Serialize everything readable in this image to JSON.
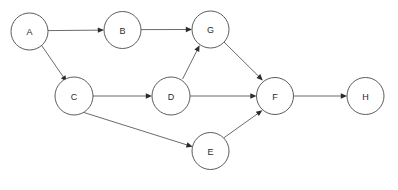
{
  "diagram": {
    "type": "directed-graph",
    "title": "",
    "canvas": {
      "width": 398,
      "height": 190,
      "background": "#ffffff"
    },
    "style": {
      "node_fill": "#ffffff",
      "node_stroke": "#4a4a4a",
      "node_stroke_width": 0.9,
      "edge_stroke": "#5a5a5a",
      "edge_stroke_width": 0.9,
      "arrowhead_fill": "#2b2b2b",
      "label_color": "#2b2b2b",
      "label_font_size": 9
    },
    "nodes": [
      {
        "id": "A",
        "label": "A",
        "cx": 29.5,
        "cy": 31.5,
        "r": 18.5
      },
      {
        "id": "B",
        "label": "B",
        "cx": 122.5,
        "cy": 30.0,
        "r": 18.5
      },
      {
        "id": "G",
        "label": "G",
        "cx": 210.5,
        "cy": 29.5,
        "r": 18.5
      },
      {
        "id": "C",
        "label": "C",
        "cx": 74.0,
        "cy": 96.0,
        "r": 19.0
      },
      {
        "id": "D",
        "label": "D",
        "cx": 171.0,
        "cy": 96.0,
        "r": 19.0
      },
      {
        "id": "F",
        "label": "F",
        "cx": 275.0,
        "cy": 96.0,
        "r": 18.5
      },
      {
        "id": "H",
        "label": "H",
        "cx": 365.5,
        "cy": 96.0,
        "r": 18.5
      },
      {
        "id": "E",
        "label": "E",
        "cx": 210.5,
        "cy": 151.0,
        "r": 18.5
      }
    ],
    "edges": [
      {
        "id": "A-B",
        "from": "A",
        "to": "B",
        "label": "",
        "directed": true,
        "x1": 48.0,
        "y1": 30.6,
        "x2": 104.0,
        "y2": 30.1
      },
      {
        "id": "B-G",
        "from": "B",
        "to": "G",
        "label": "",
        "directed": true,
        "x1": 141.0,
        "y1": 29.6,
        "x2": 192.0,
        "y2": 29.5
      },
      {
        "id": "A-C",
        "from": "A",
        "to": "C",
        "label": "",
        "directed": true,
        "x1": 41.5,
        "y1": 45.3,
        "x2": 66.7,
        "y2": 81.8
      },
      {
        "id": "C-D",
        "from": "C",
        "to": "D",
        "label": "",
        "directed": true,
        "x1": 93.0,
        "y1": 96.0,
        "x2": 152.0,
        "y2": 96.0
      },
      {
        "id": "D-G",
        "from": "D",
        "to": "G",
        "label": "",
        "directed": true,
        "x1": 182.6,
        "y1": 79.0,
        "x2": 199.6,
        "y2": 45.3
      },
      {
        "id": "D-F",
        "from": "D",
        "to": "F",
        "label": "",
        "directed": true,
        "x1": 190.0,
        "y1": 96.0,
        "x2": 256.5,
        "y2": 96.0
      },
      {
        "id": "G-F",
        "from": "G",
        "to": "F",
        "label": "",
        "directed": true,
        "x1": 224.0,
        "y1": 42.0,
        "x2": 262.8,
        "y2": 80.4
      },
      {
        "id": "C-E",
        "from": "C",
        "to": "E",
        "label": "",
        "directed": true,
        "x1": 81.0,
        "y1": 111.6,
        "x2": 192.6,
        "y2": 146.7
      },
      {
        "id": "E-F",
        "from": "E",
        "to": "F",
        "label": "",
        "directed": true,
        "x1": 223.9,
        "y1": 137.8,
        "x2": 262.4,
        "y2": 110.3
      },
      {
        "id": "F-H",
        "from": "F",
        "to": "H",
        "label": "",
        "directed": true,
        "x1": 293.5,
        "y1": 96.0,
        "x2": 347.0,
        "y2": 96.0
      }
    ]
  }
}
